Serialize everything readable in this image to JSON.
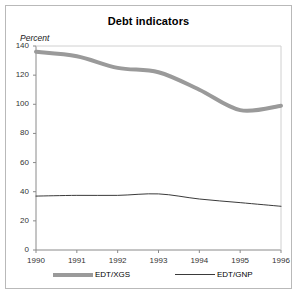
{
  "chart_data": {
    "type": "line",
    "title": "Debt indicators",
    "ylabel": "Percent",
    "xlabel": "",
    "x": [
      1990,
      1991,
      1992,
      1993,
      1994,
      1995,
      1996
    ],
    "xtick_labels": [
      "1990",
      "1991",
      "1992",
      "1993",
      "1994",
      "1995",
      "1996"
    ],
    "ytick_labels": [
      "0",
      "20",
      "40",
      "60",
      "80",
      "100",
      "120",
      "140"
    ],
    "yticks": [
      0,
      20,
      40,
      60,
      80,
      100,
      120,
      140
    ],
    "ylim": [
      0,
      140
    ],
    "xlim": [
      1990,
      1996
    ],
    "grid": false,
    "legend_position": "below",
    "series": [
      {
        "name": "EDT/XGS",
        "values": [
          136,
          133,
          125,
          122,
          110,
          96,
          99
        ],
        "color": "#9a9a9a",
        "line_width": 4,
        "style": "thick-gray"
      },
      {
        "name": "EDT/GNP",
        "values": [
          37,
          37.5,
          37.5,
          38.5,
          35,
          32.5,
          30
        ],
        "color": "#3a3a3a",
        "line_width": 1,
        "style": "thin-black"
      }
    ]
  },
  "legend": {
    "entries": [
      {
        "label": "EDT/XGS"
      },
      {
        "label": "EDT/GNP"
      }
    ]
  },
  "colors": {
    "frame": "#b9b9b9",
    "axis": "#888888",
    "text": "#000000",
    "series_xgs": "#9a9a9a",
    "series_gnp": "#3a3a3a"
  }
}
